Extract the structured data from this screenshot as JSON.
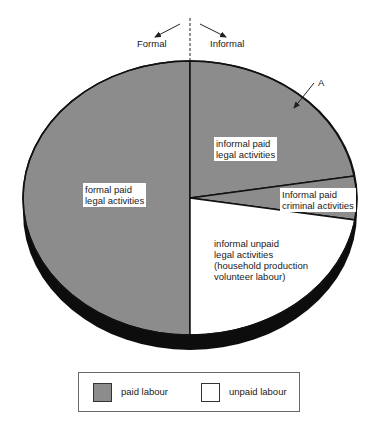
{
  "header": {
    "left_label": "Formal",
    "right_label": "Informal"
  },
  "annotation": {
    "arrow_label": "A"
  },
  "segments": [
    {
      "id": "formal-paid-legal",
      "lines": [
        "formal paid",
        "legal activities"
      ],
      "type": "paid"
    },
    {
      "id": "informal-paid-legal",
      "lines": [
        "informal paid",
        "legal activities"
      ],
      "type": "paid"
    },
    {
      "id": "informal-paid-criminal",
      "lines": [
        "Informal paid",
        "criminal activities"
      ],
      "type": "paid"
    },
    {
      "id": "informal-unpaid-legal",
      "lines": [
        "informal unpaid",
        "legal activities",
        "(household production",
        "volunteer labour)"
      ],
      "type": "unpaid"
    }
  ],
  "legend": {
    "items": [
      {
        "label": "paid labour",
        "color": "#8c8c8c"
      },
      {
        "label": "unpaid labour",
        "color": "#ffffff"
      }
    ]
  },
  "colors": {
    "paid": "#8c8c8c",
    "unpaid": "#ffffff",
    "outline": "#111111",
    "depth": "#0d0d0d"
  }
}
